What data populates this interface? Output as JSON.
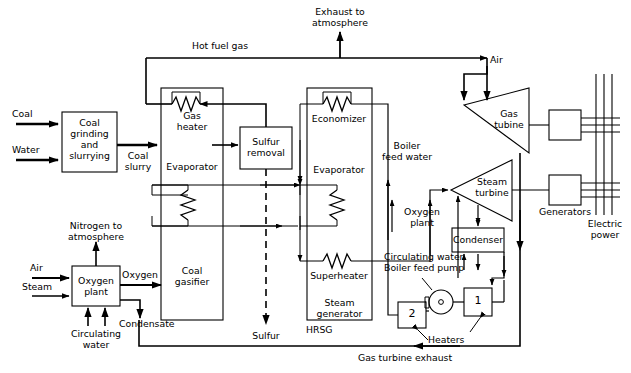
{
  "diagram": {
    "type": "process-flow-diagram",
    "stroke_color": "#000000",
    "background_color": "#ffffff"
  },
  "blocks": {
    "coal_grinding": "Coal\ngrinding\nand\nslurrying",
    "gas_heater": "Gas\nheater",
    "evaporator_gasifier": "Evaporator",
    "coal_gasifier": "Coal\ngasifier",
    "sulfur_removal": "Sulfur\nremoval",
    "economizer": "Economizer",
    "evaporator_hrsg": "Evaporator",
    "superheater": "Superheater",
    "steam_generator": "Steam\ngenerator",
    "hrsg": "HRSG",
    "oxygen_plant": "Oxygen\nplant",
    "gas_turbine": "Gas\ntubine",
    "steam_turbine": "Steam\nturbine",
    "condenser": "Condenser",
    "generators": "Generators",
    "heater_one": "1",
    "heater_two": "2"
  },
  "streams": {
    "coal": "Coal",
    "water": "Water",
    "coal_slurry": "Coal\nslurry",
    "hot_fuel_gas": "Hot fuel gas",
    "exhaust_to_atmosphere": "Exhaust to\natmosphere",
    "air_turbine": "Air",
    "air_oxygen_plant": "Air",
    "steam_oxygen_plant": "Steam",
    "nitrogen_to_atmosphere": "Nitrogen to\natmosphere",
    "oxygen": "Oxygen",
    "condensate": "Condensate",
    "circulating_water_oxygen": "Circulating\nwater",
    "sulfur": "Sulfur",
    "boiler_feed_water": "Boiler\nfeed water",
    "oxygen_plant_stream": "Oxygen\nplant",
    "circulating_water": "Circulating water",
    "boiler_feed_pump": "Boiler feed pump",
    "heaters": "Heaters",
    "gas_turbine_exhaust": "Gas turbine exhaust",
    "electric_power": "Electric\npower"
  }
}
